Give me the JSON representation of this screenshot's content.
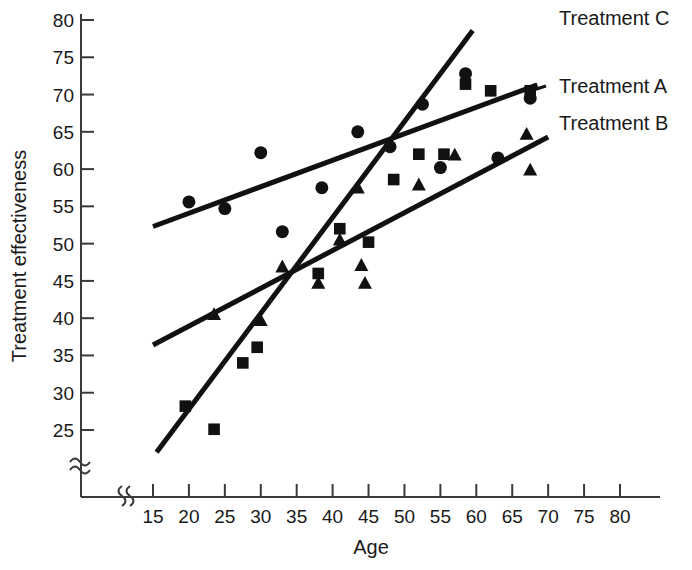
{
  "chart_data": {
    "type": "scatter",
    "title": "",
    "xlabel": "Age",
    "ylabel": "Treatment effectiveness",
    "xlim": [
      15,
      80
    ],
    "ylim": [
      25,
      80
    ],
    "x_ticks": [
      15,
      20,
      25,
      30,
      35,
      40,
      45,
      50,
      55,
      60,
      65,
      70,
      75,
      80
    ],
    "y_ticks": [
      25,
      30,
      35,
      40,
      45,
      50,
      55,
      60,
      65,
      70,
      75,
      80
    ],
    "grid": false,
    "x_axis_break": true,
    "y_axis_break": true,
    "legend_position": "right",
    "series": [
      {
        "name": "Treatment A",
        "marker": "circle",
        "color": "#111111",
        "points": [
          {
            "x": 20.0,
            "y": 55.6
          },
          {
            "x": 25.0,
            "y": 54.7
          },
          {
            "x": 30.0,
            "y": 62.2
          },
          {
            "x": 33.0,
            "y": 51.6
          },
          {
            "x": 38.5,
            "y": 57.5
          },
          {
            "x": 43.5,
            "y": 65.0
          },
          {
            "x": 48.0,
            "y": 63.0
          },
          {
            "x": 52.5,
            "y": 68.7
          },
          {
            "x": 55.0,
            "y": 60.2
          },
          {
            "x": 58.5,
            "y": 72.8
          },
          {
            "x": 63.0,
            "y": 61.5
          },
          {
            "x": 67.5,
            "y": 69.5
          }
        ],
        "trend": {
          "x1": 15.0,
          "y1": 52.3,
          "x2": 68.5,
          "y2": 71.3
        }
      },
      {
        "name": "Treatment B",
        "marker": "triangle",
        "color": "#111111",
        "points": [
          {
            "x": 23.5,
            "y": 40.6
          },
          {
            "x": 30.0,
            "y": 39.8
          },
          {
            "x": 33.0,
            "y": 47.0
          },
          {
            "x": 38.0,
            "y": 44.8
          },
          {
            "x": 41.0,
            "y": 50.6
          },
          {
            "x": 43.5,
            "y": 57.6
          },
          {
            "x": 44.0,
            "y": 47.2
          },
          {
            "x": 44.5,
            "y": 44.8
          },
          {
            "x": 52.0,
            "y": 58.0
          },
          {
            "x": 57.0,
            "y": 62.0
          },
          {
            "x": 67.0,
            "y": 64.8
          },
          {
            "x": 67.5,
            "y": 60.0
          }
        ],
        "trend": {
          "x1": 15.0,
          "y1": 36.4,
          "x2": 70.0,
          "y2": 64.3
        }
      },
      {
        "name": "Treatment C",
        "marker": "square",
        "color": "#111111",
        "points": [
          {
            "x": 19.5,
            "y": 28.2
          },
          {
            "x": 23.5,
            "y": 25.1
          },
          {
            "x": 27.5,
            "y": 34.0
          },
          {
            "x": 29.5,
            "y": 36.1
          },
          {
            "x": 38.0,
            "y": 46.0
          },
          {
            "x": 41.0,
            "y": 52.0
          },
          {
            "x": 45.0,
            "y": 50.2
          },
          {
            "x": 48.5,
            "y": 58.6
          },
          {
            "x": 52.0,
            "y": 62.0
          },
          {
            "x": 55.5,
            "y": 62.0
          },
          {
            "x": 58.5,
            "y": 71.4
          },
          {
            "x": 62.0,
            "y": 70.5
          },
          {
            "x": 67.5,
            "y": 70.5
          }
        ],
        "trend": {
          "x1": 15.5,
          "y1": 22.0,
          "x2": 59.5,
          "y2": 78.6
        }
      }
    ],
    "legend": [
      {
        "label": "Treatment C"
      },
      {
        "label": "Treatment A"
      },
      {
        "label": "Treatment B"
      }
    ]
  },
  "axis": {
    "x_title": "Age",
    "y_title": "Treatment effectiveness",
    "x_tick_labels": [
      "15",
      "20",
      "25",
      "30",
      "35",
      "40",
      "45",
      "50",
      "55",
      "60",
      "65",
      "70",
      "75",
      "80"
    ],
    "y_tick_labels": [
      "25",
      "30",
      "35",
      "40",
      "45",
      "50",
      "55",
      "60",
      "65",
      "70",
      "75",
      "80"
    ]
  },
  "legend": {
    "treatment_c": "Treatment C",
    "treatment_a": "Treatment A",
    "treatment_b": "Treatment B"
  }
}
